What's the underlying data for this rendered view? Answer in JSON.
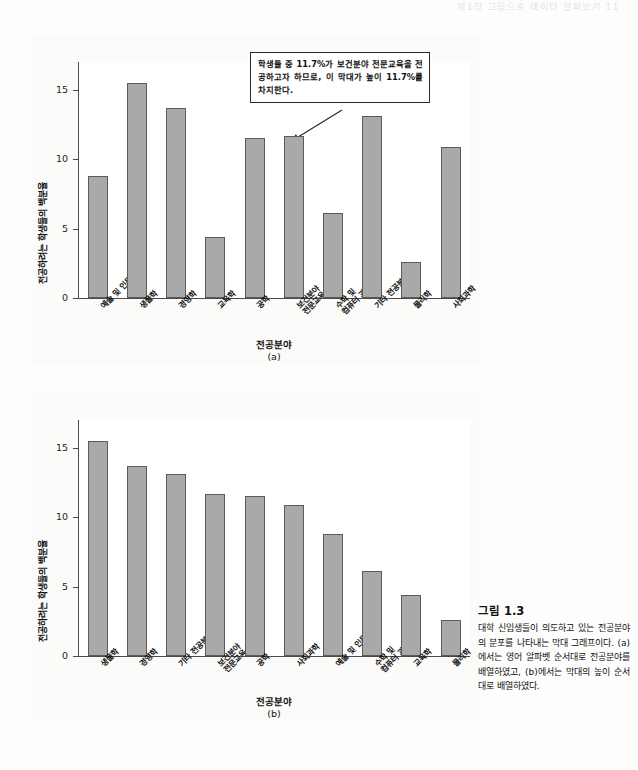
{
  "running_header": "제1장  그림으로 데이터 살펴보기   11",
  "callout": {
    "text": "학생들 중 11.7%가 보건분야 전문교육을 전공하고자 하므로, 이 막대가 높이 11.7%를 차지한다."
  },
  "caption": {
    "title": "그림 1.3",
    "body": "대학 신입생들이 의도하고 있는 전공분야의 분포를 나타내는 막대 그래프이다. (a)에서는 영어 알파벳 순서대로 전공분야를 배열하였고, (b)에서는 막대의 높이 순서대로 배열하였다."
  },
  "chart_data": [
    {
      "type": "bar",
      "panel": "a",
      "panel_label": "(a)",
      "title": "",
      "xlabel": "전공분야",
      "ylabel": "전공하려는 학생들의 백분율",
      "ylim": [
        0,
        17
      ],
      "yticks": [
        0,
        5,
        10,
        15
      ],
      "ytick_labels": [
        "0",
        "5",
        "10",
        "15"
      ],
      "grid": false,
      "legend": "none",
      "sort": "영어 알파벳 순서",
      "categories": [
        "예술 및 인문학",
        "생물학",
        "경영학",
        "교육학",
        "공학",
        "보건분야 전문교육",
        "수학 및 컴퓨터 과학",
        "기타 전공분야",
        "물리학",
        "사회과학"
      ],
      "category_lines": [
        [
          "예술 및 인문학"
        ],
        [
          "생물학"
        ],
        [
          "경영학"
        ],
        [
          "교육학"
        ],
        [
          "공학"
        ],
        [
          "보건분야",
          "전문교육"
        ],
        [
          "수학 및",
          "컴퓨터 과학"
        ],
        [
          "기타 전공분야"
        ],
        [
          "물리학"
        ],
        [
          "사회과학"
        ]
      ],
      "values": [
        8.8,
        15.5,
        13.7,
        4.4,
        11.5,
        11.7,
        6.1,
        13.1,
        2.6,
        10.9
      ],
      "annotated_category": "보건분야 전문교육",
      "annotated_value": 11.7
    },
    {
      "type": "bar",
      "panel": "b",
      "panel_label": "(b)",
      "title": "",
      "xlabel": "전공분야",
      "ylabel": "전공하려는 학생들의 백분율",
      "ylim": [
        0,
        17
      ],
      "yticks": [
        0,
        5,
        10,
        15
      ],
      "ytick_labels": [
        "0",
        "5",
        "10",
        "15"
      ],
      "grid": false,
      "legend": "none",
      "sort": "막대의 높이 순서",
      "categories": [
        "생물학",
        "경영학",
        "기타 전공분야",
        "보건분야 전문교육",
        "공학",
        "사회과학",
        "예술 및 인문학",
        "수학 및 컴퓨터 과학",
        "교육학",
        "물리학"
      ],
      "category_lines": [
        [
          "생물학"
        ],
        [
          "경영학"
        ],
        [
          "기타 전공분야"
        ],
        [
          "보건분야",
          "전문교육"
        ],
        [
          "공학"
        ],
        [
          "사회과학"
        ],
        [
          "예술 및 인문학"
        ],
        [
          "수학 및",
          "컴퓨터 과학"
        ],
        [
          "교육학"
        ],
        [
          "물리학"
        ]
      ],
      "values": [
        15.5,
        13.7,
        13.1,
        11.7,
        11.5,
        10.9,
        8.8,
        6.1,
        4.4,
        2.6
      ]
    }
  ]
}
